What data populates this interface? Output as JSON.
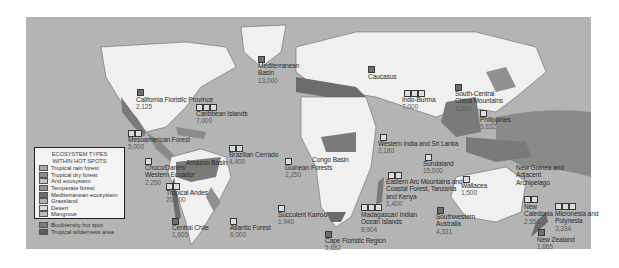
{
  "map": {
    "title": "Biodiversity hot spots and ecosystem types",
    "background_color": "#ffffff",
    "ocean_color": "#b4b4b4",
    "land_color": "#f0f0f0",
    "hotspot_color": "#6e6e6e",
    "wilderness_color": "#8a8a8a"
  },
  "legend": {
    "title_line1": "ECOSYSTEM TYPES",
    "title_line2": "WITHIN HOT SPOTS",
    "items": [
      {
        "label": "Tropical rain forest",
        "color": "#a8a8a8"
      },
      {
        "label": "Tropical dry forest",
        "color": "#8c8c8c"
      },
      {
        "label": "Arid ecosystem",
        "color": "#c4c4c4"
      },
      {
        "label": "Temperate forest",
        "color": "#909090"
      },
      {
        "label": "Mediterranean ecosystem",
        "color": "#6c6c6c"
      },
      {
        "label": "Grassland",
        "color": "#b0b0b0"
      },
      {
        "label": "Desert",
        "color": "#d8d8d8"
      },
      {
        "label": "Mangrove",
        "color": "#bcbcbc"
      }
    ],
    "overlays": [
      {
        "label": "Biodiversity hot spot",
        "color": "#7a7a7a"
      },
      {
        "label": "Tropical wilderness area",
        "color": "#5c5c5c"
      }
    ]
  },
  "hotspots": [
    {
      "name": "California Floristic Province",
      "value": "2,125",
      "markers": [
        "d"
      ]
    },
    {
      "name": "Caribbean Islands",
      "value": "7,000",
      "markers": [
        "l",
        "l",
        "l"
      ]
    },
    {
      "name": "Mesoamerican Forest",
      "value": "5,000",
      "markers": [
        "l",
        "l"
      ]
    },
    {
      "name": "Choco/Darien/ Western Ecuador",
      "value": "2,250",
      "markers": [
        "l"
      ]
    },
    {
      "name": "Amazon Basin",
      "value": "",
      "markers": []
    },
    {
      "name": "Brazilian Cerrado",
      "value": "4,400",
      "markers": [
        "l",
        "l"
      ]
    },
    {
      "name": "Tropical Andes",
      "value": "20,000",
      "markers": [
        "l",
        "l"
      ]
    },
    {
      "name": "Central Chile",
      "value": "1,605",
      "markers": [
        "d"
      ]
    },
    {
      "name": "Atlantic Forest",
      "value": "6,000",
      "markers": [
        "l"
      ]
    },
    {
      "name": "Mediterranean Basin",
      "value": "13,000",
      "markers": [
        "d"
      ]
    },
    {
      "name": "Guinean Forests",
      "value": "2,250",
      "markers": [
        "l"
      ]
    },
    {
      "name": "Congo Basin",
      "value": "",
      "markers": []
    },
    {
      "name": "Succulent Karroo",
      "value": "1,940",
      "markers": [
        "l"
      ]
    },
    {
      "name": "Cape Floristic Region",
      "value": "5,682",
      "markers": [
        "d"
      ]
    },
    {
      "name": "Caucasus",
      "value": "1,600",
      "markers": [
        "d"
      ]
    },
    {
      "name": "Indo-Burma",
      "value": "7,000",
      "markers": [
        "l",
        "l",
        "l"
      ]
    },
    {
      "name": "South-Central China Mountains",
      "value": "3,500",
      "markers": [
        "d"
      ]
    },
    {
      "name": "Philippines",
      "value": "5,832",
      "markers": [
        "l"
      ]
    },
    {
      "name": "Western India and Sri Lanka",
      "value": "2,180",
      "markers": [
        "l"
      ]
    },
    {
      "name": "Sundaland",
      "value": "15,000",
      "markers": [
        "l"
      ]
    },
    {
      "name": "Eastern Arc Mountains and Coastal Forest, Tanzania and Kenya",
      "value": "1,400",
      "markers": [
        "l",
        "l"
      ]
    },
    {
      "name": "Madagascar/ Indian Ocean Islands",
      "value": "8,904",
      "markers": [
        "l",
        "l",
        "l"
      ]
    },
    {
      "name": "Wallacea",
      "value": "1,500",
      "markers": [
        "l"
      ]
    },
    {
      "name": "New Guinea and Adjacent Archipelago",
      "value": "",
      "markers": []
    },
    {
      "name": "Southwestern Australia",
      "value": "4,331",
      "markers": [
        "d"
      ]
    },
    {
      "name": "New Caledonia",
      "value": "2,551",
      "markers": [
        "l",
        "l"
      ]
    },
    {
      "name": "Micronesia and Polynesia",
      "value": "3,334",
      "markers": [
        "l",
        "l",
        "l"
      ]
    },
    {
      "name": "New Zealand",
      "value": "1,865",
      "markers": [
        "d"
      ]
    }
  ]
}
